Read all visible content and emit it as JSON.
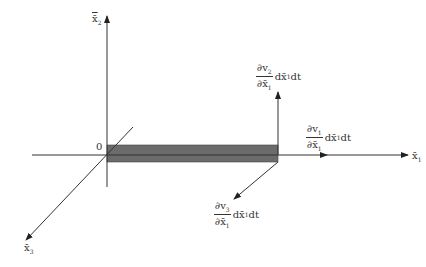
{
  "diagram": {
    "axes": {
      "x1": {
        "label": "x̄",
        "sub": "1"
      },
      "x2": {
        "label": "x̄",
        "sub": "2"
      },
      "x3": {
        "label": "x̄",
        "sub": "3"
      },
      "origin": "0"
    },
    "annotations": [
      {
        "id": "v2",
        "num": "∂v",
        "num_sub": "2",
        "den": "∂x̄",
        "den_sub": "1",
        "tail": "dx̄",
        "tail_sub": "1",
        "tail_end": "dt"
      },
      {
        "id": "v1",
        "num": "∂v",
        "num_sub": "1",
        "den": "∂x̄",
        "den_sub": "1",
        "tail": "dx̄",
        "tail_sub": "1",
        "tail_end": "dt"
      },
      {
        "id": "v3",
        "num": "∂v",
        "num_sub": "3",
        "den": "∂x̄",
        "den_sub": "1",
        "tail": "dx̄",
        "tail_sub": "1",
        "tail_end": "dt"
      }
    ],
    "colors": {
      "element_fill": "#6b6b6b",
      "line": "#333333"
    }
  }
}
